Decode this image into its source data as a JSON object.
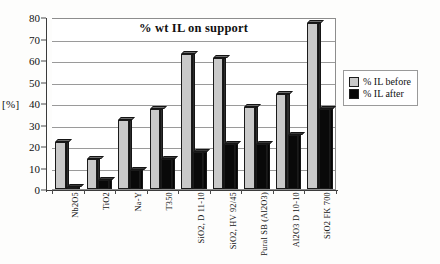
{
  "chart_data": {
    "type": "bar",
    "title": "% wt IL on support",
    "xlabel": "",
    "ylabel": "[%]",
    "ylim": [
      0,
      80
    ],
    "yticks": [
      0,
      10,
      20,
      30,
      40,
      50,
      60,
      70,
      80
    ],
    "grid": true,
    "legend_position": "right",
    "categories": [
      "Nb2O5",
      "TiO2",
      "Na-Y",
      "T350",
      "SiO2, D 11-10",
      "SiO2, HV 92/45",
      "Pural SB (Al2O3)",
      "Al2O3 D 10-10",
      "SiO2 FK 700"
    ],
    "series": [
      {
        "name": "% IL before",
        "color": "#c9c9c9",
        "values": [
          22,
          14,
          32,
          37,
          63,
          61,
          38,
          44,
          77
        ]
      },
      {
        "name": "% IL after",
        "color": "#080808",
        "values": [
          1,
          4,
          9,
          14,
          17,
          21,
          21,
          25,
          37
        ]
      }
    ]
  },
  "legend": {
    "entries": [
      {
        "label": "% IL before"
      },
      {
        "label": "% IL after"
      }
    ]
  },
  "axis": {
    "y_title": "[%]",
    "y_tick_labels": [
      "0",
      "10",
      "20",
      "30",
      "40",
      "50",
      "60",
      "70",
      "80"
    ]
  }
}
